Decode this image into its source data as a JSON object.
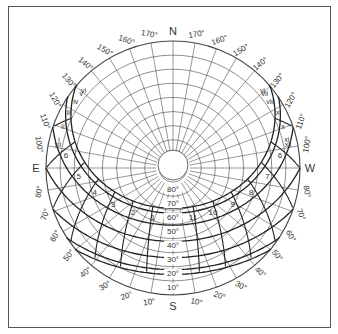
{
  "diagram": {
    "type": "sun-path-diagram",
    "cardinals": {
      "north": "N",
      "south": "S",
      "east": "E",
      "west": "W"
    },
    "azimuth_labels_top_left": [
      "170°",
      "160°",
      "150°",
      "140°",
      "130°",
      "120°",
      "110°",
      "100°"
    ],
    "azimuth_labels_top_right": [
      "170°",
      "160°",
      "150°",
      "140°",
      "130°",
      "120°",
      "110°",
      "100°"
    ],
    "azimuth_labels_bottom_left": [
      "80°",
      "70°",
      "60°",
      "50°",
      "40°",
      "30°",
      "20°",
      "10°"
    ],
    "azimuth_labels_bottom_right": [
      "10°",
      "20°",
      "30°",
      "40°",
      "50°",
      "60°",
      "70°",
      "80°"
    ],
    "altitude_labels": [
      "80°",
      "70°",
      "60°",
      "50°",
      "40°",
      "30°",
      "20°",
      "10°"
    ],
    "hour_labels_morning": [
      "6",
      "5",
      "4",
      "3",
      "2",
      "1"
    ],
    "hour_labels_afternoon": [
      "11",
      "10",
      "9",
      "8",
      "7",
      "6"
    ],
    "month_labels_east": [
      "vi",
      "v",
      "iv",
      "iii",
      "ii",
      "i",
      "xii"
    ],
    "month_labels_west": [
      "vi",
      "vii",
      "viii",
      "ix",
      "x",
      "xi",
      "xii"
    ],
    "colors": {
      "line": "#222222",
      "grid": "#444444",
      "frame": "#555555",
      "text": "#333333"
    }
  }
}
